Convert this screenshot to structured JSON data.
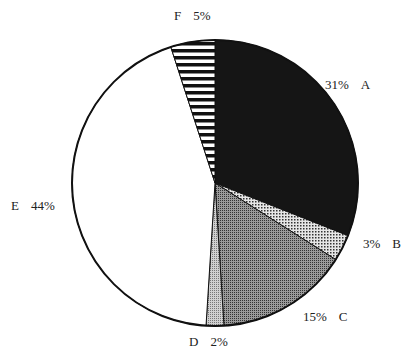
{
  "chart_data": {
    "type": "pie",
    "title": "",
    "start_angle_deg": 0,
    "direction": "clockwise",
    "slices": [
      {
        "label": "A",
        "value": 31,
        "pct_text": "31%",
        "fill": "#1a1a1a",
        "pattern": "solid-dark"
      },
      {
        "label": "B",
        "value": 3,
        "pct_text": "3%",
        "fill": "#bdbdbd",
        "pattern": "fine-dots"
      },
      {
        "label": "C",
        "value": 15,
        "pct_text": "15%",
        "fill": "#7a7a7a",
        "pattern": "dense-dots"
      },
      {
        "label": "D",
        "value": 2,
        "pct_text": "2%",
        "fill": "#a8a8a8",
        "pattern": "light-dots"
      },
      {
        "label": "E",
        "value": 44,
        "pct_text": "44%",
        "fill": "#ffffff",
        "pattern": "none"
      },
      {
        "label": "F",
        "value": 5,
        "pct_text": "5%",
        "fill": "#ffffff",
        "pattern": "horizontal-stripes"
      }
    ]
  },
  "labels": {
    "A": {
      "pct": "31%",
      "name": "A"
    },
    "B": {
      "pct": "3%",
      "name": "B"
    },
    "C": {
      "pct": "15%",
      "name": "C"
    },
    "D": {
      "name": "D",
      "pct": "2%"
    },
    "E": {
      "name": "E",
      "pct": "44%"
    },
    "F": {
      "name": "F",
      "pct": "5%"
    }
  }
}
